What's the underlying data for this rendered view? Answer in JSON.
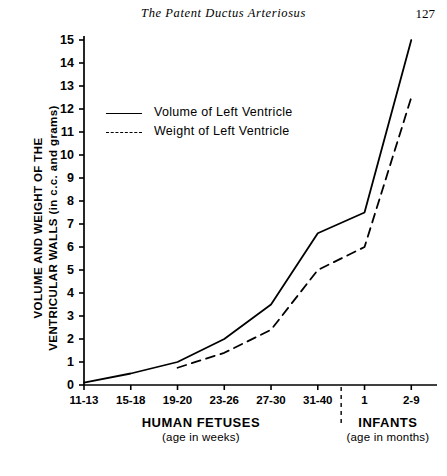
{
  "running_head": {
    "title": "The Patent Ductus Arteriosus",
    "page_number": "127"
  },
  "chart_data": {
    "type": "line",
    "title": "",
    "xlabel": "",
    "ylabel": "VOLUME AND WEIGHT OF THE VENTRICULAR WALLS (in c.c. and grams)",
    "ylabel_line1": "VOLUME AND WEIGHT OF THE",
    "ylabel_line2": "VENTRICULAR WALLS (in c.c. and grams)",
    "ylim": [
      0,
      15
    ],
    "ytick_step": 1,
    "yticks": [
      "0",
      "1",
      "2",
      "3",
      "4",
      "5",
      "6",
      "7",
      "8",
      "9",
      "10",
      "11",
      "12",
      "13",
      "14",
      "15"
    ],
    "categories": [
      "11-13",
      "15-18",
      "19-20",
      "23-26",
      "27-30",
      "31-40",
      "1",
      "2-9"
    ],
    "grid": false,
    "legend_position": "upper-left-inside",
    "series": [
      {
        "name": "Volume of Left Ventricle",
        "style": "solid",
        "values": [
          0.1,
          0.5,
          1.0,
          2.0,
          3.5,
          6.6,
          7.5,
          15.0
        ]
      },
      {
        "name": "Weight of Left Ventricle",
        "style": "dashed",
        "values": [
          null,
          null,
          0.75,
          1.4,
          2.4,
          5.0,
          6.0,
          12.5
        ]
      }
    ],
    "groups": [
      {
        "name": "HUMAN FETUSES",
        "subtitle": "(age in weeks)",
        "categories": [
          "11-13",
          "15-18",
          "19-20",
          "23-26",
          "27-30",
          "31-40"
        ]
      },
      {
        "name": "INFANTS",
        "subtitle": "(age in months)",
        "categories": [
          "1",
          "2-9"
        ]
      }
    ],
    "divider": {
      "style": "dashed",
      "between": [
        "31-40",
        "1"
      ]
    },
    "colors": {
      "axis": "#000000",
      "series": "#000000",
      "background": "#ffffff"
    }
  }
}
